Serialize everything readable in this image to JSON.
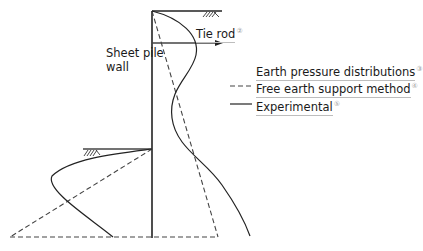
{
  "diagram": {
    "wall_label_line1": "Sheet pile",
    "wall_label_line2": "wall",
    "tie_rod": {
      "label": "Tie rod",
      "marker": "②"
    },
    "legend": {
      "title": {
        "label": "Earth pressure distributions",
        "marker": "③"
      },
      "items": [
        {
          "label": "Free earth support method",
          "marker": "④",
          "style": "dashed"
        },
        {
          "label": "Experimental",
          "marker": "⑤",
          "style": "solid"
        }
      ]
    },
    "ground_hatch_top": "ground-hatch",
    "ground_hatch_dredge": "ground-hatch",
    "colors": {
      "line": "#222222",
      "dashed": "#444444",
      "underline": "#bdbdbd",
      "marker": "#9a9a9a"
    }
  }
}
